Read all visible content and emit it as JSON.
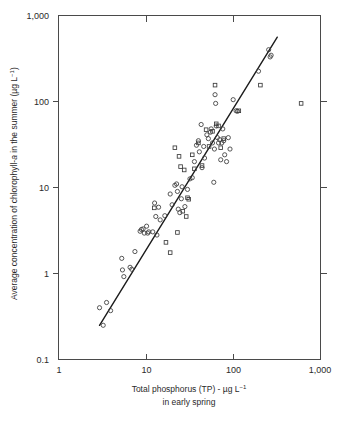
{
  "figure": {
    "background_color": "#ffffff",
    "marker_color": "#3a3a3a",
    "line_color": "#1c1c1c",
    "axis_color": "#4a4a4a"
  },
  "axis_titles": {
    "y_main": "Average concentration of chlorophyll-",
    "y_italic": "a",
    "y_tail": " in the summer (µg L",
    "y_sup": "−1",
    "y_close": ")",
    "x_line1_a": "Total phosphorus (TP) - µg L",
    "x_line1_sup": "−1",
    "x_line2": "in early spring"
  },
  "ticks": {
    "x_labels": [
      "1",
      "10",
      "100",
      "1,000"
    ],
    "y_labels": [
      "0.1",
      "1",
      "10",
      "100",
      "1,000"
    ]
  },
  "chart_data": {
    "type": "scatter",
    "title": "",
    "xlabel": "Total phosphorus (TP) - µg L−1 in early spring",
    "ylabel": "Average concentration of chlorophyll-a in the summer (µg L−1)",
    "xscale": "log",
    "yscale": "log",
    "xlim": [
      1,
      1000
    ],
    "ylim": [
      0.1,
      1000
    ],
    "xticks": [
      1,
      10,
      100,
      1000
    ],
    "yticks": [
      0.1,
      1,
      10,
      100,
      1000
    ],
    "grid": false,
    "legend": null,
    "series": [
      {
        "name": "circles",
        "marker": "open-circle",
        "points": [
          [
            2.95,
            0.4
          ],
          [
            3.25,
            0.25
          ],
          [
            3.55,
            0.46
          ],
          [
            3.95,
            0.37
          ],
          [
            5.3,
            1.5
          ],
          [
            5.4,
            1.1
          ],
          [
            5.6,
            0.92
          ],
          [
            6.6,
            1.18
          ],
          [
            6.9,
            1.12
          ],
          [
            7.5,
            1.8
          ],
          [
            8.6,
            3.1
          ],
          [
            8.9,
            3.25
          ],
          [
            9.3,
            3.3
          ],
          [
            9.6,
            2.95
          ],
          [
            10.2,
            3.55
          ],
          [
            10.5,
            2.95
          ],
          [
            10.8,
            3.05
          ],
          [
            12.0,
            3.05
          ],
          [
            12.6,
            6.6
          ],
          [
            13.0,
            4.6
          ],
          [
            13.4,
            2.8
          ],
          [
            14.0,
            5.9
          ],
          [
            14.6,
            4.2
          ],
          [
            16.5,
            4.7
          ],
          [
            19.0,
            8.4
          ],
          [
            20.0,
            6.3
          ],
          [
            21.5,
            10.6
          ],
          [
            22.5,
            11.0
          ],
          [
            23.0,
            9.0
          ],
          [
            23.5,
            5.6
          ],
          [
            24.5,
            5.1
          ],
          [
            25.5,
            7.4
          ],
          [
            26.0,
            10.2
          ],
          [
            28.0,
            6.0
          ],
          [
            30.0,
            9.5
          ],
          [
            32.0,
            12.6
          ],
          [
            34.0,
            13.0
          ],
          [
            36.0,
            20.0
          ],
          [
            38.0,
            31.0
          ],
          [
            40.0,
            35.0
          ],
          [
            41.0,
            26.0
          ],
          [
            43.0,
            54.0
          ],
          [
            44.0,
            17.0
          ],
          [
            46.0,
            30.0
          ],
          [
            47.0,
            22.0
          ],
          [
            50.0,
            41.0
          ],
          [
            52.0,
            37.0
          ],
          [
            55.0,
            44.0
          ],
          [
            56.0,
            48.0
          ],
          [
            58.0,
            33.0
          ],
          [
            60.0,
            11.5
          ],
          [
            61.0,
            28.0
          ],
          [
            62.0,
            120.0
          ],
          [
            63.0,
            95.0
          ],
          [
            64.0,
            52.0
          ],
          [
            66.0,
            38.0
          ],
          [
            68.0,
            33.0
          ],
          [
            70.0,
            36.0
          ],
          [
            72.0,
            21.0
          ],
          [
            74.0,
            33.0
          ],
          [
            76.0,
            48.0
          ],
          [
            78.0,
            35.0
          ],
          [
            80.0,
            24.0
          ],
          [
            84.0,
            20.0
          ],
          [
            88.0,
            38.0
          ],
          [
            92.0,
            28.0
          ],
          [
            100.0,
            105.0
          ],
          [
            108.0,
            78.0
          ],
          [
            112.0,
            77.0
          ],
          [
            195.0,
            225.0
          ],
          [
            255.0,
            400.0
          ],
          [
            265.0,
            330.0
          ],
          [
            272.0,
            345.0
          ]
        ]
      },
      {
        "name": "squares",
        "marker": "open-square",
        "points": [
          [
            12.5,
            5.8
          ],
          [
            17.0,
            2.3
          ],
          [
            19.0,
            1.75
          ],
          [
            21.5,
            29.0
          ],
          [
            23.0,
            3.0
          ],
          [
            24.0,
            23.0
          ],
          [
            25.0,
            17.5
          ],
          [
            26.5,
            5.3
          ],
          [
            27.5,
            16.0
          ],
          [
            29.0,
            4.6
          ],
          [
            30.0,
            7.6
          ],
          [
            31.0,
            7.3
          ],
          [
            34.0,
            24.0
          ],
          [
            36.0,
            16.5
          ],
          [
            40.0,
            33.0
          ],
          [
            44.0,
            18.0
          ],
          [
            49.0,
            47.0
          ],
          [
            53.0,
            30.0
          ],
          [
            58.0,
            45.0
          ],
          [
            62.0,
            155.0
          ],
          [
            64.0,
            55.0
          ],
          [
            68.0,
            52.0
          ],
          [
            72.0,
            29.0
          ],
          [
            78.0,
            37.0
          ],
          [
            116.0,
            78.0
          ],
          [
            205.0,
            155.0
          ],
          [
            600.0,
            95.0
          ]
        ]
      }
    ],
    "fit_line": {
      "description": "regression line",
      "x_start": 2.95,
      "y_start": 0.25,
      "x_end": 320.0,
      "y_end": 560.0
    }
  }
}
